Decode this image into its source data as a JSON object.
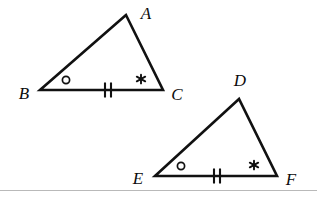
{
  "figure": {
    "type": "geometry-diagram",
    "background_color": "#ffffff",
    "stroke_color": "#111111",
    "label_color": "#0b0b0b",
    "width": 317,
    "height": 199
  },
  "triangles": [
    {
      "name": "triangle-abc",
      "vertices": [
        {
          "id": "A",
          "label": "A",
          "x": 126,
          "y": 15,
          "label_x": 146,
          "label_y": 13
        },
        {
          "id": "B",
          "label": "B",
          "x": 40,
          "y": 90,
          "label_x": 24,
          "label_y": 93
        },
        {
          "id": "C",
          "label": "C",
          "x": 163,
          "y": 90,
          "label_x": 177,
          "label_y": 94
        }
      ],
      "angle_marks": [
        {
          "type": "circle-mark",
          "at_vertex": "B",
          "x": 66,
          "y": 80,
          "radius": 3.6
        },
        {
          "type": "asterisk-mark",
          "at_vertex": "C",
          "x": 141,
          "y": 79,
          "glyph": "*"
        }
      ],
      "side_marks": [
        {
          "type": "double-tick",
          "on_side": "BC",
          "x": 108,
          "y": 90,
          "count": 2
        }
      ]
    },
    {
      "name": "triangle-def",
      "vertices": [
        {
          "id": "D",
          "label": "D",
          "x": 239,
          "y": 99,
          "label_x": 240,
          "label_y": 80
        },
        {
          "id": "E",
          "label": "E",
          "x": 155,
          "y": 176,
          "label_x": 138,
          "label_y": 178
        },
        {
          "id": "F",
          "label": "F",
          "x": 277,
          "y": 176,
          "label_x": 291,
          "label_y": 179
        }
      ],
      "angle_marks": [
        {
          "type": "circle-mark",
          "at_vertex": "E",
          "x": 181,
          "y": 166,
          "radius": 3.6
        },
        {
          "type": "asterisk-mark",
          "at_vertex": "F",
          "x": 254,
          "y": 165,
          "glyph": "*"
        }
      ],
      "side_marks": [
        {
          "type": "double-tick",
          "on_side": "EF",
          "x": 217,
          "y": 176,
          "count": 2
        }
      ]
    }
  ],
  "bottom_rule": {
    "y": 190,
    "color": "#b9b9b9"
  }
}
